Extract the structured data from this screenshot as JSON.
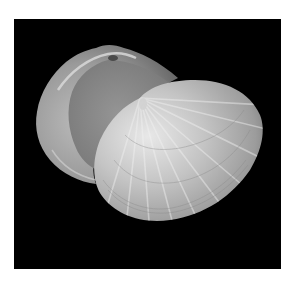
{
  "image": {
    "subject": "Bivalve clam shell with both valves visible",
    "background": "#000000",
    "frame": "#ffffff",
    "shell_colors": {
      "highlight": "#e6e6e6",
      "mid": "#b4b4b4",
      "shadow": "#6e6e6e",
      "interior": "#8c8c8c"
    }
  }
}
